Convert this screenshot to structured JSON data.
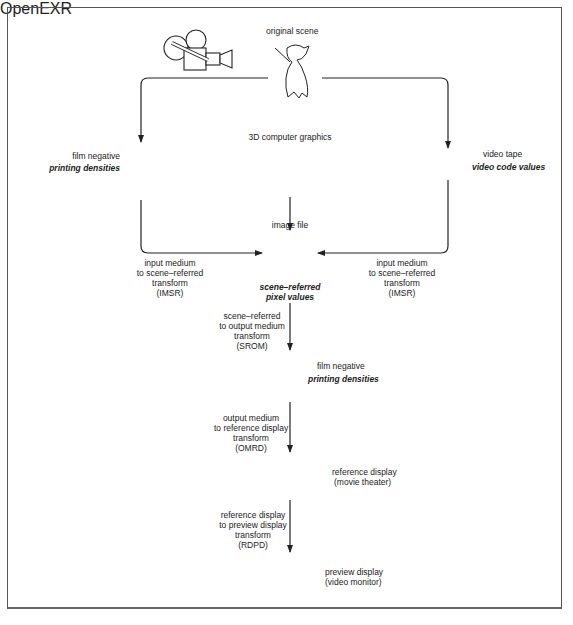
{
  "diagram": {
    "title": "",
    "nodes": {
      "original_scene": {
        "label": "original scene"
      },
      "film_camera": {
        "icon": "film-camera-icon"
      },
      "video_camera": {
        "icon": "video-camera-icon"
      },
      "film_negative_top": {
        "label": "film negative",
        "sublabel": "printing densities",
        "icon": "film-strip-icon"
      },
      "cg": {
        "label": "3D computer graphics",
        "icon": "sphere-on-grid-icon"
      },
      "video_tape": {
        "label": "video tape",
        "sublabel": "video code values",
        "icon": "video-cassette-icon"
      },
      "image_file": {
        "label": "image file",
        "logo_text": "OpenEXR",
        "sublabel_line1": "scene–referred",
        "sublabel_line2": "pixel values",
        "icon": "openexr-logo-icon"
      },
      "film_negative_mid": {
        "label": "film negative",
        "sublabel": "printing densities",
        "icon": "film-strip-icon"
      },
      "reference_display": {
        "line1": "reference display",
        "line2": "(movie theater)",
        "icon": "movie-theater-icon"
      },
      "preview_display": {
        "line1": "preview display",
        "line2": "(video monitor)",
        "icon": "video-monitor-icon"
      }
    },
    "transforms": {
      "imsr_left": {
        "lines": [
          "input medium",
          "to scene–referred",
          "transform",
          "(IMSR)"
        ]
      },
      "imsr_right": {
        "lines": [
          "input medium",
          "to scene–referred",
          "transform",
          "(IMSR)"
        ]
      },
      "srom": {
        "lines": [
          "scene–referred",
          "to output medium",
          "transform",
          "(SROM)"
        ]
      },
      "omrd": {
        "lines": [
          "output medium",
          "to reference display",
          "transform",
          "(OMRD)"
        ]
      },
      "rdpd": {
        "lines": [
          "reference display",
          "to preview display",
          "transform",
          "(RDPD)"
        ]
      }
    },
    "edges": [
      {
        "from": "original_scene",
        "to": "film_negative_top"
      },
      {
        "from": "original_scene",
        "to": "video_tape"
      },
      {
        "from": "film_negative_top",
        "to": "image_file",
        "via": "IMSR"
      },
      {
        "from": "video_tape",
        "to": "image_file",
        "via": "IMSR"
      },
      {
        "from": "cg",
        "to": "image_file"
      },
      {
        "from": "image_file",
        "to": "film_negative_mid",
        "via": "SROM"
      },
      {
        "from": "film_negative_mid",
        "to": "reference_display",
        "via": "OMRD"
      },
      {
        "from": "reference_display",
        "to": "preview_display",
        "via": "RDPD"
      }
    ]
  }
}
